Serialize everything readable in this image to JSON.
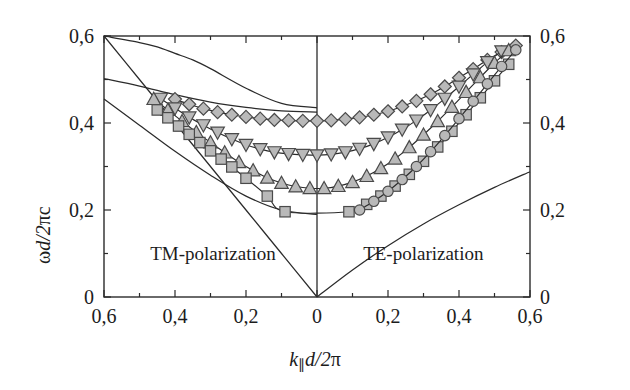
{
  "figure": {
    "background": "#ffffff",
    "line_color": "#2b2b2b",
    "marker_fill": "#b9b9b9",
    "marker_edge": "#4a4a4a"
  },
  "annotations": {
    "left_region": "TM-polarization",
    "right_region": "TE-polarization"
  },
  "axis": {
    "y_label_main": "d/2",
    "y_label_omega": "ω",
    "y_label_pi": "πc",
    "x_label_k": "k",
    "x_label_sub": "∥",
    "x_label_rest": "d/2",
    "x_label_pi": "π"
  },
  "chart_data": {
    "type": "line",
    "title": "",
    "xlabel": "k∥d/2π",
    "ylabel": "ωd/2πc",
    "xlim": [
      -0.6,
      0.6
    ],
    "ylim": [
      0.0,
      0.6
    ],
    "grid": false,
    "legend": "none",
    "x_tick_values": [
      -0.6,
      -0.4,
      -0.2,
      0,
      0.2,
      0.4,
      0.6
    ],
    "x_tick_labels": [
      "0,6",
      "0,4",
      "0,2",
      "0",
      "0,2",
      "0,4",
      "0,6"
    ],
    "x_minor_step": 0.1,
    "y_tick_values": [
      0,
      0.2,
      0.4,
      0.6
    ],
    "y_tick_labels_left": [
      "0",
      "0,2",
      "0,4",
      "0,6"
    ],
    "y_tick_labels_right": [
      "0",
      "0,2",
      "0,4",
      "0,6"
    ],
    "y_minor_step": 0.1,
    "note_left_half": "TM-polarization (negative x side)",
    "note_right_half": "TE-polarization (positive x side)",
    "series": [
      {
        "name": "TM light line",
        "marker": "none",
        "side": "left",
        "x": [
          -0.6,
          -0.5,
          -0.4,
          -0.3,
          -0.2,
          -0.1,
          0.0
        ],
        "values": [
          0.6,
          0.5,
          0.4,
          0.3,
          0.2,
          0.1,
          0.0
        ]
      },
      {
        "name": "TM band 1 (diamond curve, theory)",
        "marker": "none",
        "side": "left",
        "x": [
          -0.6,
          -0.5,
          -0.45,
          -0.4,
          -0.35,
          -0.3,
          -0.2,
          -0.1,
          0.0
        ],
        "values": [
          0.6,
          0.585,
          0.575,
          0.56,
          0.545,
          0.525,
          0.48,
          0.445,
          0.435
        ]
      },
      {
        "name": "TM band 2 (theory)",
        "marker": "none",
        "side": "left",
        "x": [
          -0.6,
          -0.5,
          -0.4,
          -0.3,
          -0.2,
          -0.1,
          0.0
        ],
        "values": [
          0.502,
          0.485,
          0.465,
          0.448,
          0.436,
          0.428,
          0.425
        ]
      },
      {
        "name": "TM band 3 (theory)",
        "marker": "none",
        "side": "left",
        "x": [
          -0.6,
          -0.5,
          -0.4,
          -0.3,
          -0.2,
          -0.1,
          0.0
        ],
        "values": [
          0.455,
          0.395,
          0.335,
          0.28,
          0.232,
          0.2,
          0.19
        ]
      },
      {
        "name": "TE light line",
        "marker": "none",
        "side": "right",
        "x": [
          0.0,
          0.1,
          0.2,
          0.3,
          0.4,
          0.5,
          0.6
        ],
        "values": [
          0.0,
          0.062,
          0.118,
          0.168,
          0.212,
          0.252,
          0.288
        ]
      },
      {
        "name": "Band A (diamonds)",
        "marker": "diamond",
        "side": "both",
        "x": [
          -0.4,
          -0.36,
          -0.32,
          -0.28,
          -0.24,
          -0.2,
          -0.16,
          -0.12,
          -0.08,
          -0.04,
          0.0,
          0.04,
          0.08,
          0.12,
          0.16,
          0.2,
          0.24,
          0.28,
          0.32,
          0.36,
          0.4,
          0.44,
          0.48,
          0.52,
          0.56
        ],
        "values": [
          0.455,
          0.443,
          0.433,
          0.425,
          0.419,
          0.414,
          0.41,
          0.407,
          0.406,
          0.405,
          0.405,
          0.406,
          0.409,
          0.413,
          0.419,
          0.427,
          0.438,
          0.451,
          0.466,
          0.484,
          0.504,
          0.524,
          0.545,
          0.563,
          0.578
        ]
      },
      {
        "name": "Band B (down-triangles)",
        "marker": "triangle-down",
        "side": "both",
        "x": [
          -0.44,
          -0.4,
          -0.36,
          -0.32,
          -0.28,
          -0.24,
          -0.2,
          -0.16,
          -0.12,
          -0.08,
          -0.04,
          0.0,
          0.04,
          0.08,
          0.12,
          0.16,
          0.2,
          0.24,
          0.28,
          0.32,
          0.36,
          0.4,
          0.44,
          0.48,
          0.52
        ],
        "values": [
          0.456,
          0.434,
          0.413,
          0.395,
          0.378,
          0.363,
          0.35,
          0.34,
          0.333,
          0.329,
          0.327,
          0.326,
          0.328,
          0.333,
          0.341,
          0.352,
          0.367,
          0.385,
          0.406,
          0.43,
          0.456,
          0.484,
          0.512,
          0.54,
          0.565
        ]
      },
      {
        "name": "Band C (up-triangles)",
        "marker": "triangle-up",
        "side": "both",
        "x": [
          -0.46,
          -0.42,
          -0.38,
          -0.34,
          -0.3,
          -0.26,
          -0.22,
          -0.18,
          -0.14,
          -0.1,
          -0.06,
          -0.02,
          0.02,
          0.06,
          0.1,
          0.14,
          0.18,
          0.22,
          0.26,
          0.3,
          0.34,
          0.38,
          0.42,
          0.46,
          0.5,
          0.54
        ],
        "values": [
          0.455,
          0.43,
          0.404,
          0.379,
          0.355,
          0.332,
          0.31,
          0.291,
          0.274,
          0.262,
          0.254,
          0.25,
          0.25,
          0.255,
          0.264,
          0.278,
          0.296,
          0.318,
          0.344,
          0.373,
          0.404,
          0.437,
          0.471,
          0.505,
          0.538,
          0.567
        ]
      },
      {
        "name": "Band D (squares)",
        "marker": "square",
        "side": "both",
        "x": [
          -0.45,
          -0.42,
          -0.39,
          -0.36,
          -0.33,
          -0.3,
          -0.27,
          -0.24,
          -0.2,
          -0.14,
          -0.09,
          0.09,
          0.14,
          0.18,
          0.22,
          0.26,
          0.3,
          0.34,
          0.38,
          0.42,
          0.46,
          0.5,
          0.54
        ],
        "values": [
          0.43,
          0.412,
          0.393,
          0.374,
          0.355,
          0.336,
          0.317,
          0.299,
          0.273,
          0.232,
          0.196,
          0.196,
          0.213,
          0.232,
          0.255,
          0.282,
          0.312,
          0.345,
          0.381,
          0.419,
          0.458,
          0.497,
          0.535
        ]
      },
      {
        "name": "Band E (circles)",
        "marker": "circle",
        "side": "right",
        "x": [
          0.12,
          0.16,
          0.2,
          0.24,
          0.28,
          0.32,
          0.36,
          0.4,
          0.44,
          0.48,
          0.52,
          0.56
        ],
        "values": [
          0.2,
          0.22,
          0.243,
          0.27,
          0.3,
          0.334,
          0.371,
          0.41,
          0.45,
          0.49,
          0.53,
          0.568
        ]
      }
    ]
  }
}
